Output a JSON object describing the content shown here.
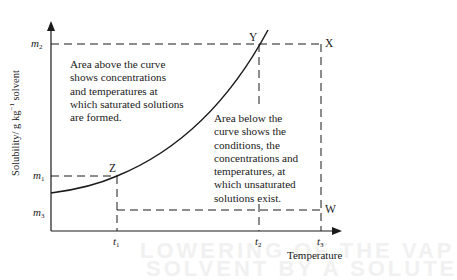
{
  "diagram": {
    "type": "solubility-curve",
    "y_axis": {
      "label_prefix": "Solubility/ g kg",
      "label_exponent": "−1",
      "label_suffix": " solvent",
      "ticks": [
        {
          "symbol": "m",
          "subscript": "2"
        },
        {
          "symbol": "m",
          "subscript": "1"
        },
        {
          "symbol": "m",
          "subscript": "3"
        }
      ]
    },
    "x_axis": {
      "label": "Temperature",
      "ticks": [
        {
          "symbol": "t",
          "subscript": "1"
        },
        {
          "symbol": "t",
          "subscript": "2"
        },
        {
          "symbol": "t",
          "subscript": "3"
        }
      ]
    },
    "points": {
      "X": "X",
      "Y": "Y",
      "Z": "Z",
      "W": "W"
    },
    "annotations": {
      "above_curve": "Area above the curve\nshows concentrations\nand temperatures at\nwhich saturated solutions\nare formed.",
      "below_curve": "Area below the\ncurve shows the\nconditions, the\nconcentrations and\ntemperatures, at\nwhich unsaturated\nsolutions exist."
    },
    "colors": {
      "ink": "#1a1a1a",
      "background": "#ffffff",
      "bleed_through": "#f1f1f1"
    }
  },
  "background_bleed": {
    "line1": "LOWERING OF THE VAP",
    "line2": "SOLVENT BY A SOLUTE"
  }
}
